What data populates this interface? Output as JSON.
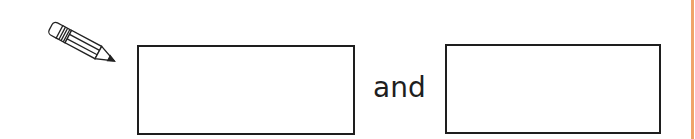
{
  "worksheet": {
    "conjunction": "and",
    "icons": {
      "pencil": "pencil-icon"
    },
    "answer_boxes": [
      {
        "id": "box1",
        "value": ""
      },
      {
        "id": "box2",
        "value": ""
      }
    ],
    "colors": {
      "border": "#1e1e1e",
      "edge_line": "#f0a46a"
    }
  }
}
